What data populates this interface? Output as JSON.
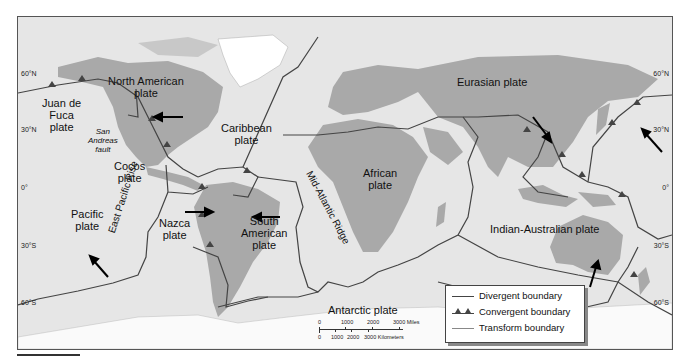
{
  "map": {
    "title": "Tectonic plates of the world",
    "plates": [
      {
        "id": "north-american",
        "label_lines": [
          "North American",
          "plate"
        ]
      },
      {
        "id": "juan-de-fuca",
        "label_lines": [
          "Juan de",
          "Fuca",
          "plate"
        ]
      },
      {
        "id": "caribbean",
        "label_lines": [
          "Caribbean",
          "plate"
        ]
      },
      {
        "id": "cocos",
        "label_lines": [
          "Cocos",
          "plate"
        ]
      },
      {
        "id": "pacific",
        "label_lines": [
          "Pacific",
          "plate"
        ]
      },
      {
        "id": "nazca",
        "label_lines": [
          "Nazca",
          "plate"
        ]
      },
      {
        "id": "south-american",
        "label_lines": [
          "South",
          "American",
          "plate"
        ]
      },
      {
        "id": "african",
        "label_lines": [
          "African",
          "plate"
        ]
      },
      {
        "id": "eurasian",
        "label_lines": [
          "Eurasian plate"
        ]
      },
      {
        "id": "indian-australian",
        "label_lines": [
          "Indian-Australian plate"
        ]
      },
      {
        "id": "antarctic",
        "label_lines": [
          "Antarctic plate"
        ]
      }
    ],
    "features": {
      "san_andreas": [
        "San",
        "Andreas",
        "fault"
      ],
      "east_pacific_rise": "East Pacific Rise",
      "mid_atlantic_ridge": "Mid-Atlantic Ridge"
    },
    "latitudes": {
      "left": [
        "60°N",
        "30°N",
        "0°",
        "30°S",
        "60°S"
      ],
      "right": [
        "60°N",
        "30°N",
        "0°",
        "30°S",
        "60°S"
      ]
    },
    "legend": {
      "items": [
        {
          "label": "Divergent boundary",
          "style": "line"
        },
        {
          "label": "Convergent boundary",
          "style": "triangles"
        },
        {
          "label": "Transform boundary",
          "style": "thin-line"
        }
      ]
    },
    "scale": {
      "miles_ticks": [
        "0",
        "1000",
        "2000",
        "3000 Miles"
      ],
      "km_ticks": [
        "0",
        "1000",
        "2000",
        "3000 Kilometers"
      ]
    },
    "colors": {
      "ocean": "#e6e6e6",
      "land": "#a9a9a9",
      "ice": "#ffffff",
      "boundary": "#444444"
    }
  }
}
